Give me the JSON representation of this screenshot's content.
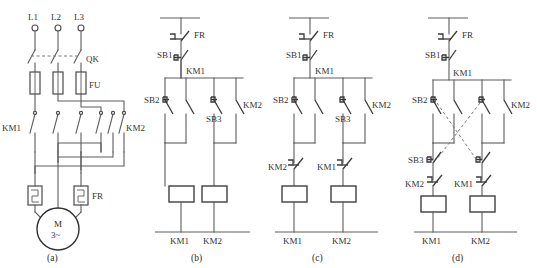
{
  "figure": {
    "background_color": "#ffffff",
    "line_color": "#5c5c5c",
    "text_color": "#343434"
  },
  "panels": [
    {
      "id": "a",
      "caption": "(a)",
      "type": "power-circuit",
      "labels": {
        "L1": "L1",
        "L2": "L2",
        "L3": "L3",
        "QK": "QK",
        "FU": "FU",
        "KM1": "KM1",
        "KM2": "KM2",
        "FR": "FR",
        "motor_line1": "M",
        "motor_line2": "3~"
      }
    },
    {
      "id": "b",
      "caption": "(b)",
      "type": "control-circuit",
      "labels": {
        "FR": "FR",
        "SB1": "SB1",
        "KM1_aux": "KM1",
        "SB2": "SB2",
        "SB3": "SB3",
        "KM2_aux": "KM2",
        "coil_left": "KM1",
        "coil_right": "KM2"
      }
    },
    {
      "id": "c",
      "caption": "(c)",
      "type": "control-circuit-interlocked",
      "labels": {
        "FR": "FR",
        "SB1": "SB1",
        "KM1_aux": "KM1",
        "SB2": "SB2",
        "SB3": "SB3",
        "KM2_aux": "KM2",
        "interlock_left": "KM2",
        "interlock_right": "KM1",
        "coil_left": "KM1",
        "coil_right": "KM2"
      }
    },
    {
      "id": "d",
      "caption": "(d)",
      "type": "control-circuit-double-interlocked",
      "labels": {
        "FR": "FR",
        "SB1": "SB1",
        "KM1_aux": "KM1",
        "SB2": "SB2",
        "SB3": "SB3",
        "KM2_aux": "KM2",
        "interlock_left": "KM2",
        "interlock_right": "KM1",
        "coil_left": "KM1",
        "coil_right": "KM2"
      }
    }
  ]
}
